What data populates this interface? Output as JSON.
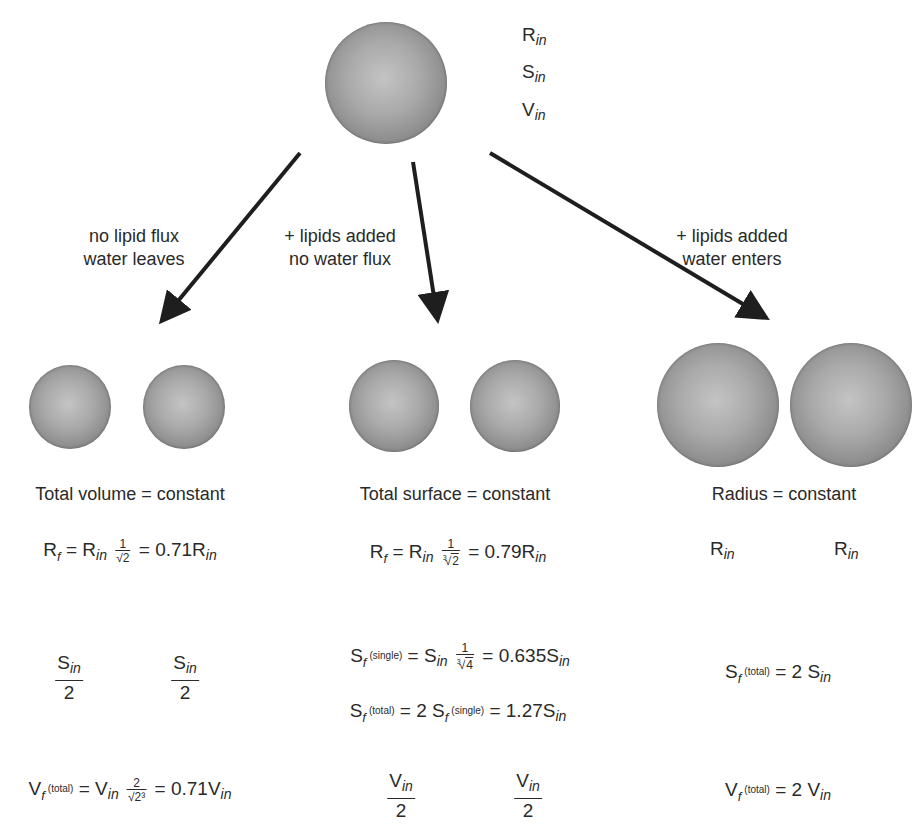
{
  "initial": {
    "labels": [
      {
        "base": "R",
        "sub": "in"
      },
      {
        "base": "S",
        "sub": "in"
      },
      {
        "base": "V",
        "sub": "in"
      }
    ]
  },
  "arrows": [
    {
      "label_line1": "no lipid flux",
      "label_line2": "water leaves"
    },
    {
      "label_line1": "+ lipids added",
      "label_line2": "no water flux"
    },
    {
      "label_line1": "+ lipids added",
      "label_line2": "water enters"
    }
  ],
  "branches": {
    "left": {
      "title": "Total volume = constant",
      "radius_eq": {
        "lhs_base": "R",
        "lhs_sub": "f",
        "rhs_base": "R",
        "rhs_sub": "in",
        "frac_num": "1",
        "frac_den": "√2",
        "equals": "=",
        "result_value": "0.71R",
        "result_sub": "in"
      },
      "surface_each": {
        "num_base": "S",
        "num_sub": "in",
        "den": "2"
      },
      "volume_eq": {
        "lhs_base": "V",
        "lhs_sub": "f",
        "lhs_sup": "(total)",
        "rhs_base": "V",
        "rhs_sub": "in",
        "frac_num": "2",
        "frac_den": "√2³",
        "equals": "=",
        "result_value": "0.71V",
        "result_sub": "in"
      }
    },
    "middle": {
      "title": "Total surface = constant",
      "radius_eq": {
        "lhs_base": "R",
        "lhs_sub": "f",
        "rhs_base": "R",
        "rhs_sub": "in",
        "frac_num": "1",
        "frac_den_index": "3",
        "frac_den": "2",
        "equals": "=",
        "result_value": "0.79R",
        "result_sub": "in"
      },
      "surface_single_eq": {
        "lhs_base": "S",
        "lhs_sub": "f",
        "lhs_sup": "(single)",
        "rhs_base": "S",
        "rhs_sub": "in",
        "frac_num": "1",
        "frac_den_index": "3",
        "frac_den": "4",
        "equals": "=",
        "result_value": "0.635S",
        "result_sub": "in"
      },
      "surface_total_eq": {
        "lhs_base": "S",
        "lhs_sub": "f",
        "lhs_sup": "(total)",
        "mid": "= 2 S",
        "mid_sub": "f",
        "mid_sup": "(single)",
        "equals": "=",
        "result_value": "1.27S",
        "result_sub": "in"
      },
      "volume_each": {
        "num_base": "V",
        "num_sub": "in",
        "den": "2"
      }
    },
    "right": {
      "title": "Radius = constant",
      "radius_each": {
        "base": "R",
        "sub": "in"
      },
      "surface_total_eq": {
        "lhs_base": "S",
        "lhs_sub": "f",
        "lhs_sup": "(total)",
        "rhs": "= 2 S",
        "rhs_sub": "in"
      },
      "volume_total_eq": {
        "lhs_base": "V",
        "lhs_sub": "f",
        "lhs_sup": "(total)",
        "rhs": "= 2 V",
        "rhs_sub": "in"
      }
    }
  },
  "colors": {
    "arrow": "#1e1e1e",
    "text": "#2a2a2a",
    "sphere_light": "#c4c4c4",
    "sphere_dark": "#6c6c6c"
  }
}
